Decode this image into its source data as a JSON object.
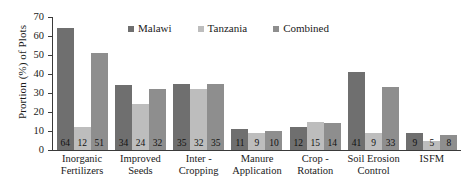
{
  "chart_data": {
    "type": "bar",
    "title": "",
    "xlabel": "",
    "ylabel": "Prortion (%) of Plots",
    "ylim": [
      0,
      70
    ],
    "yticks": [
      0,
      10,
      20,
      30,
      40,
      50,
      60,
      70
    ],
    "grid": false,
    "legend_position": "top-center",
    "categories": [
      "Inorganic Fertilizers",
      "Improved Seeds",
      "Inter - Cropping",
      "Manure Application",
      "Crop - Rotation",
      "Soil Erosion Control",
      "ISFM"
    ],
    "category_lines": [
      [
        "Inorganic",
        "Fertilizers"
      ],
      [
        "Improved",
        "Seeds"
      ],
      [
        "Inter -",
        "Cropping"
      ],
      [
        "Manure",
        "Application"
      ],
      [
        "Crop -",
        "Rotation"
      ],
      [
        "Soil Erosion",
        "Control"
      ],
      [
        "ISFM",
        ""
      ]
    ],
    "series": [
      {
        "name": "Malawi",
        "color": "#6f6f6f",
        "values": [
          64,
          34,
          35,
          11,
          12,
          41,
          9
        ]
      },
      {
        "name": "Tanzania",
        "color": "#bdbdbd",
        "values": [
          12,
          24,
          32,
          9,
          15,
          9,
          5
        ]
      },
      {
        "name": "Combined",
        "color": "#8e8e8e",
        "values": [
          51,
          32,
          35,
          10,
          14,
          33,
          8
        ]
      }
    ]
  },
  "legend": {
    "items": [
      {
        "label": "Malawi",
        "color": "#6f6f6f"
      },
      {
        "label": "Tanzania",
        "color": "#bdbdbd"
      },
      {
        "label": "Combined",
        "color": "#8e8e8e"
      }
    ]
  },
  "axis": {
    "y_title": "Prortion (%) of Plots",
    "y_ticks": [
      "70",
      "60",
      "50",
      "40",
      "30",
      "20",
      "10",
      "0"
    ]
  }
}
